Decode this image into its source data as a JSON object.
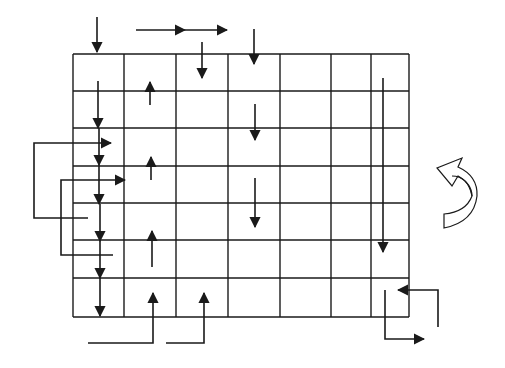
{
  "diagram": {
    "type": "grid-flow-diagram",
    "grid": {
      "columns_x": [
        73,
        124,
        176,
        228,
        280,
        331,
        371,
        409
      ],
      "rows_y": [
        54,
        91,
        128,
        166,
        203,
        240,
        278,
        317
      ],
      "rows": 7,
      "cols": 7
    },
    "colors": {
      "stroke": "#1a1a1a",
      "background": "#ffffff"
    },
    "arrows": [
      {
        "id": "top-down-col1",
        "points": [
          [
            97,
            17
          ],
          [
            97,
            52
          ]
        ],
        "head": "end"
      },
      {
        "id": "top-right-1",
        "points": [
          [
            136,
            30
          ],
          [
            185,
            30
          ]
        ],
        "head": "end"
      },
      {
        "id": "top-right-2",
        "points": [
          [
            185,
            30
          ],
          [
            227,
            30
          ]
        ],
        "head": "end"
      },
      {
        "id": "top-down-col3",
        "points": [
          [
            202,
            42
          ],
          [
            202,
            78
          ]
        ],
        "head": "end"
      },
      {
        "id": "top-down-col4",
        "points": [
          [
            254,
            29
          ],
          [
            254,
            64
          ]
        ],
        "head": "end"
      },
      {
        "id": "col1-down-1",
        "points": [
          [
            98,
            81
          ],
          [
            98,
            128
          ]
        ],
        "head": "end"
      },
      {
        "id": "col1-down-2",
        "points": [
          [
            99,
            128
          ],
          [
            99,
            165
          ]
        ],
        "head": "end"
      },
      {
        "id": "col1-down-3",
        "points": [
          [
            99,
            165
          ],
          [
            99,
            204
          ]
        ],
        "head": "end"
      },
      {
        "id": "col1-down-4",
        "points": [
          [
            100,
            204
          ],
          [
            100,
            241
          ]
        ],
        "head": "end"
      },
      {
        "id": "col1-down-5",
        "points": [
          [
            100,
            241
          ],
          [
            100,
            278
          ]
        ],
        "head": "end"
      },
      {
        "id": "col1-down-6",
        "points": [
          [
            100,
            278
          ],
          [
            100,
            316
          ]
        ],
        "head": "end"
      },
      {
        "id": "col2-up-1",
        "points": [
          [
            150,
            105
          ],
          [
            150,
            82
          ]
        ],
        "head": "end"
      },
      {
        "id": "col2-up-2",
        "points": [
          [
            151,
            180
          ],
          [
            151,
            157
          ]
        ],
        "head": "end"
      },
      {
        "id": "col2-up-3",
        "points": [
          [
            152,
            267
          ],
          [
            152,
            231
          ]
        ],
        "head": "end"
      },
      {
        "id": "col4-down-2",
        "points": [
          [
            255,
            104
          ],
          [
            255,
            140
          ]
        ],
        "head": "end"
      },
      {
        "id": "col4-down-3",
        "points": [
          [
            255,
            178
          ],
          [
            255,
            227
          ]
        ],
        "head": "end"
      },
      {
        "id": "right-col-long-down",
        "points": [
          [
            383,
            78
          ],
          [
            383,
            252
          ]
        ],
        "head": "end"
      },
      {
        "id": "loop-outer",
        "points": [
          [
            88,
            218
          ],
          [
            34,
            218
          ],
          [
            34,
            143
          ],
          [
            111,
            143
          ]
        ],
        "head": "both-ends"
      },
      {
        "id": "loop-inner",
        "points": [
          [
            113,
            255
          ],
          [
            61,
            255
          ],
          [
            61,
            180
          ],
          [
            125,
            180
          ]
        ],
        "head": "both-ends"
      },
      {
        "id": "bottom-in-col2",
        "points": [
          [
            88,
            343
          ],
          [
            153,
            343
          ],
          [
            153,
            293
          ]
        ],
        "head": "both-ends"
      },
      {
        "id": "bottom-in-col3",
        "points": [
          [
            166,
            343
          ],
          [
            204,
            343
          ],
          [
            204,
            293
          ]
        ],
        "head": "both-ends"
      },
      {
        "id": "exit-right-bottom",
        "points": [
          [
            385,
            290
          ],
          [
            385,
            339
          ],
          [
            424,
            339
          ]
        ],
        "head": "both-ends"
      },
      {
        "id": "enter-right-bottom",
        "points": [
          [
            438,
            327
          ],
          [
            438,
            290
          ],
          [
            398,
            290
          ]
        ],
        "head": "both-ends"
      }
    ],
    "rotation_symbol": {
      "name": "counter-clockwise-rotation-arrow",
      "x": 435,
      "y": 155,
      "width": 45,
      "height": 75
    }
  }
}
